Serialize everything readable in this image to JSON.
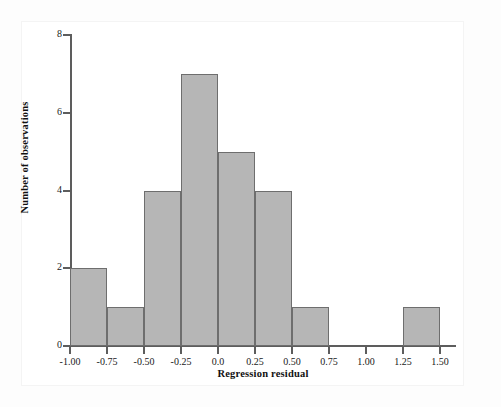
{
  "figure": {
    "background_color": "#ffffff",
    "card_color": "#ffffff",
    "bar_fill_color": "#b6b6b6",
    "bar_edge_color": "#6e6e6e",
    "axis_color": "#5d5d5d",
    "text_color": "#111111"
  },
  "chart_data": {
    "type": "bar",
    "title": "",
    "subtitle": "",
    "xlabel": "Regression residual",
    "ylabel": "Number of observations",
    "xlim": [
      -1.0,
      1.5
    ],
    "ylim": [
      0,
      8
    ],
    "grid": false,
    "legend": null,
    "bin_width": 0.25,
    "total_observations": 25,
    "x_tick_labels": [
      "-1.00",
      "-0.75",
      "-0.50",
      "-0.25",
      "0.0",
      "0.25",
      "0.50",
      "0.75",
      "1.00",
      "1.25",
      "1.50"
    ],
    "x_tick_values": [
      -1.0,
      -0.75,
      -0.5,
      -0.25,
      0.0,
      0.25,
      0.5,
      0.75,
      1.0,
      1.25,
      1.5
    ],
    "y_tick_labels": [
      "0",
      "2",
      "4",
      "6",
      "8"
    ],
    "y_tick_values": [
      0,
      2,
      4,
      6,
      8
    ],
    "categories": [
      "-1.00 to -0.75",
      "-0.75 to -0.50",
      "-0.50 to -0.25",
      "-0.25 to 0.00",
      "0.00 to 0.25",
      "0.25 to 0.50",
      "0.50 to 0.75",
      "0.75 to 1.00",
      "1.00 to 1.25",
      "1.25 to 1.50"
    ],
    "bins": [
      {
        "left": -1.0,
        "right": -0.75,
        "count": 2
      },
      {
        "left": -0.75,
        "right": -0.5,
        "count": 1
      },
      {
        "left": -0.5,
        "right": -0.25,
        "count": 4
      },
      {
        "left": -0.25,
        "right": 0.0,
        "count": 7
      },
      {
        "left": 0.0,
        "right": 0.25,
        "count": 5
      },
      {
        "left": 0.25,
        "right": 0.5,
        "count": 4
      },
      {
        "left": 0.5,
        "right": 0.75,
        "count": 1
      },
      {
        "left": 0.75,
        "right": 1.0,
        "count": 0
      },
      {
        "left": 1.0,
        "right": 1.25,
        "count": 0
      },
      {
        "left": 1.25,
        "right": 1.5,
        "count": 1
      }
    ],
    "values": [
      2,
      1,
      4,
      7,
      5,
      4,
      1,
      0,
      0,
      1
    ]
  }
}
